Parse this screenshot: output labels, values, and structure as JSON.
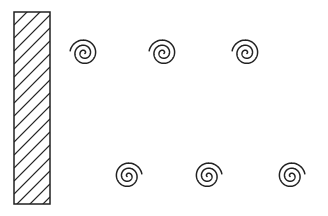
{
  "diagram": {
    "background": "#ffffff",
    "stroke_color": "#222222",
    "wall": {
      "label": "hatched-wall",
      "x": 14,
      "y": 12,
      "width": 36,
      "height": 192,
      "hatch_spacing": 13
    },
    "spirals": [
      {
        "id": "spiral-top-1",
        "cx": 84,
        "cy": 53,
        "opening": "upper-left"
      },
      {
        "id": "spiral-top-2",
        "cx": 163,
        "cy": 53,
        "opening": "upper-left"
      },
      {
        "id": "spiral-top-3",
        "cx": 246,
        "cy": 53,
        "opening": "upper-left"
      },
      {
        "id": "spiral-bottom-1",
        "cx": 128,
        "cy": 176,
        "opening": "upper-right"
      },
      {
        "id": "spiral-bottom-2",
        "cx": 208,
        "cy": 176,
        "opening": "upper-right"
      },
      {
        "id": "spiral-bottom-3",
        "cx": 291,
        "cy": 176,
        "opening": "upper-right"
      }
    ]
  }
}
